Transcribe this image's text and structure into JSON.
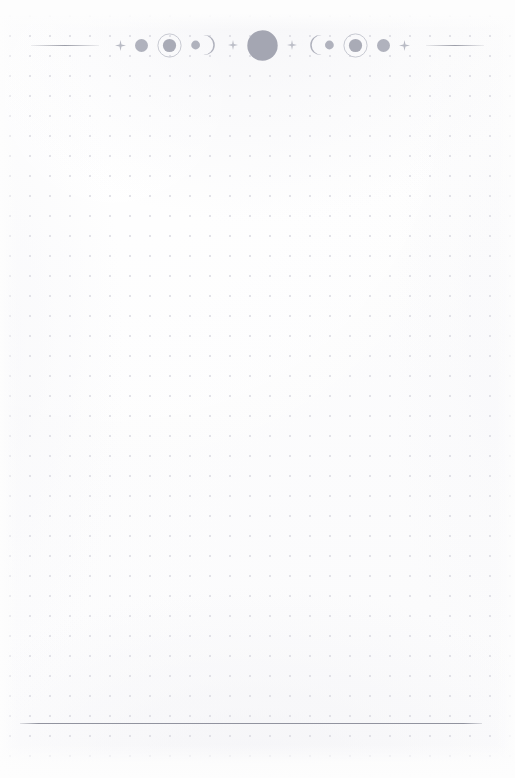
{
  "page": {
    "kind": "dot-grid-notebook-page",
    "width": 515,
    "height": 778,
    "background_color": "#fdfdfd",
    "label": "Blank dotted journal page with lunar phase header"
  },
  "grid": {
    "dot_color": "#dcdce3",
    "spacing_px": 20,
    "dot_radius_px": 0.85,
    "origin_x": 20,
    "origin_y": 26
  },
  "header": {
    "name": "lunar-phase-divider",
    "top": 25,
    "ink_color": "#a9abb6",
    "rule_color": "#9698a3",
    "left_rule": {
      "name": "header-rule-left",
      "width": 68
    },
    "right_rule": {
      "name": "header-rule-right",
      "width": 58
    },
    "ornaments": [
      {
        "type": "sparkle",
        "name": "sparkle-icon",
        "size": 9,
        "shade": "#b9bbc5"
      },
      {
        "type": "disc",
        "name": "moon-disc-small",
        "size": 13,
        "shade": "#b0b2bd"
      },
      {
        "type": "ringed-disc",
        "name": "ringed-moon-icon-left",
        "size": 24,
        "disc": 13,
        "shade": "#a9abb6",
        "ring": "#c2c4cd"
      },
      {
        "type": "dot-crescent",
        "name": "dot-crescent-icon-left",
        "size": 26,
        "shade": "#b0b2bd"
      },
      {
        "type": "sparkle",
        "name": "sparkle-icon",
        "size": 8,
        "shade": "#bcbec7"
      },
      {
        "type": "disc",
        "name": "full-moon-disc-center",
        "size": 30,
        "shade": "#a4a6b2"
      },
      {
        "type": "sparkle",
        "name": "sparkle-icon",
        "size": 8,
        "shade": "#bcbec7"
      },
      {
        "type": "crescent-dot",
        "name": "crescent-dot-icon-right",
        "size": 26,
        "shade": "#b0b2bd"
      },
      {
        "type": "ringed-disc",
        "name": "ringed-moon-icon-right",
        "size": 24,
        "disc": 13,
        "shade": "#a9abb6",
        "ring": "#c2c4cd"
      },
      {
        "type": "disc",
        "name": "moon-disc-small",
        "size": 13,
        "shade": "#b0b2bd"
      },
      {
        "type": "sparkle",
        "name": "sparkle-icon",
        "size": 9,
        "shade": "#b9bbc5"
      }
    ]
  },
  "footer": {
    "name": "footer-rule",
    "left": 20,
    "top": 723,
    "width": 462,
    "color": "#8c8e9a"
  },
  "content": {
    "body_text": ""
  }
}
